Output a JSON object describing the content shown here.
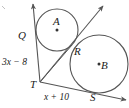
{
  "figure": {
    "stroke_color": "#555555",
    "label_color": "#1a1a1a",
    "background": "#ffffff"
  },
  "labels": {
    "center_a": "A",
    "center_b": "B",
    "point_q": "Q",
    "point_r": "R",
    "point_t": "T",
    "point_s": "S",
    "left_segment": "3x − 8",
    "bottom_segment": "x + 10"
  },
  "geometry": {
    "circle_a": {
      "cx": 57,
      "cy": 30,
      "r": 21
    },
    "circle_b": {
      "cx": 99,
      "cy": 64,
      "r": 29
    },
    "vertex_t": {
      "x": 40,
      "y": 82
    },
    "point_q": {
      "x": 31,
      "y": 38
    },
    "point_r": {
      "x": 72,
      "y": 45
    },
    "point_s": {
      "x": 96,
      "y": 95
    },
    "ray_up_left_tip": {
      "x": 33,
      "y": 3
    },
    "ray_up_right_tip": {
      "x": 104,
      "y": 5
    },
    "ray_bottom_tip": {
      "x": 127,
      "y": 100
    }
  }
}
